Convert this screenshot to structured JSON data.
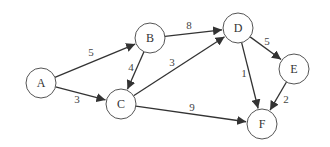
{
  "graph": {
    "type": "directed-weighted",
    "nodes": [
      {
        "id": "A",
        "label": "A",
        "x": 41,
        "y": 83
      },
      {
        "id": "B",
        "label": "B",
        "x": 150,
        "y": 38
      },
      {
        "id": "C",
        "label": "C",
        "x": 121,
        "y": 104
      },
      {
        "id": "D",
        "label": "D",
        "x": 238,
        "y": 28
      },
      {
        "id": "E",
        "label": "E",
        "x": 294,
        "y": 69
      },
      {
        "id": "F",
        "label": "F",
        "x": 262,
        "y": 124
      }
    ],
    "edges": [
      {
        "from": "A",
        "to": "B",
        "weight": "5",
        "lx": 91,
        "ly": 52
      },
      {
        "from": "A",
        "to": "C",
        "weight": "3",
        "lx": 77,
        "ly": 99
      },
      {
        "from": "B",
        "to": "C",
        "weight": "4",
        "lx": 131,
        "ly": 67
      },
      {
        "from": "B",
        "to": "D",
        "weight": "8",
        "lx": 189,
        "ly": 25
      },
      {
        "from": "C",
        "to": "D",
        "weight": "3",
        "lx": 172,
        "ly": 62
      },
      {
        "from": "C",
        "to": "F",
        "weight": "9",
        "lx": 192,
        "ly": 107
      },
      {
        "from": "D",
        "to": "E",
        "weight": "5",
        "lx": 267,
        "ly": 41
      },
      {
        "from": "D",
        "to": "F",
        "weight": "1",
        "lx": 244,
        "ly": 73
      },
      {
        "from": "E",
        "to": "F",
        "weight": "2",
        "lx": 286,
        "ly": 99
      }
    ]
  }
}
